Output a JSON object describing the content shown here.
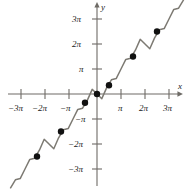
{
  "figure": {
    "background_color": "#ffffff",
    "curve_color": "#7d7a73",
    "axis_color": "#6e6b66",
    "point_color": "#111111",
    "text_color": "#1a1a1a"
  },
  "axes": {
    "x_axis_label": "x",
    "y_axis_label": "y",
    "x_ticks": [
      {
        "label": "−3π",
        "value": -3
      },
      {
        "label": "−2π",
        "value": -2
      },
      {
        "label": "−π",
        "value": -1
      },
      {
        "label": "π",
        "value": 1
      },
      {
        "label": "2π",
        "value": 2
      },
      {
        "label": "3π",
        "value": 3
      }
    ],
    "y_ticks": [
      {
        "label": "3π",
        "value": 3
      },
      {
        "label": "2π",
        "value": 2
      },
      {
        "label": "π",
        "value": 1
      },
      {
        "label": "−π",
        "value": -1
      },
      {
        "label": "−2π",
        "value": -2
      },
      {
        "label": "−3π",
        "value": -3
      }
    ]
  },
  "chart_data": {
    "type": "line",
    "title": "",
    "xlabel": "x",
    "ylabel": "y",
    "xlim": [
      -3.6,
      3.6
    ],
    "ylim": [
      -3.6,
      3.6
    ],
    "grid": false,
    "legend": "none",
    "axis_units": "multiples of pi",
    "series": [
      {
        "name": "y = x + sin(x)",
        "x": [
          -3.6,
          -3.4,
          -3.2,
          -3.0,
          -2.8,
          -2.6,
          -2.4,
          -2.2,
          -2.0,
          -1.8,
          -1.6,
          -1.4,
          -1.2,
          -1.0,
          -0.8,
          -0.6,
          -0.4,
          -0.2,
          0.0,
          0.2,
          0.4,
          0.6,
          0.8,
          1.0,
          1.2,
          1.4,
          1.6,
          1.8,
          2.0,
          2.2,
          2.4,
          2.6,
          2.8,
          3.0,
          3.2,
          3.4,
          3.6
        ],
        "y": [
          -3.753,
          -3.431,
          -3.384,
          -3.0,
          -2.616,
          -2.569,
          -2.247,
          -1.813,
          -2.0,
          -2.187,
          -1.753,
          -1.431,
          -1.384,
          -1.0,
          -0.616,
          -0.569,
          -0.247,
          0.187,
          0.0,
          -0.187,
          0.247,
          0.569,
          0.616,
          1.0,
          1.384,
          1.431,
          1.753,
          2.187,
          2.0,
          1.813,
          2.247,
          2.569,
          2.616,
          3.0,
          3.384,
          3.431,
          3.753
        ]
      }
    ],
    "marked_points": [
      {
        "x": -2.5,
        "y": -2.5
      },
      {
        "x": -1.5,
        "y": -1.5
      },
      {
        "x": -0.5,
        "y": -0.35
      },
      {
        "x": 0.0,
        "y": 0.0
      },
      {
        "x": 0.5,
        "y": 0.35
      },
      {
        "x": 1.5,
        "y": 1.5
      },
      {
        "x": 2.5,
        "y": 2.5
      }
    ]
  }
}
